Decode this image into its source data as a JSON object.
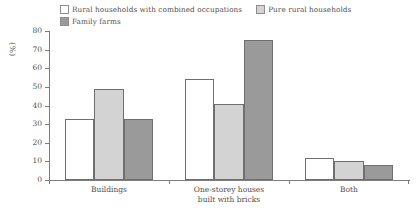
{
  "chart_data": {
    "type": "bar",
    "title": "",
    "subtitle": "",
    "xlabel": "",
    "ylabel": "(%)",
    "ylim": [
      0,
      80
    ],
    "ytick_step": 10,
    "yticks": [
      80,
      70,
      60,
      50,
      40,
      30,
      20,
      10,
      0
    ],
    "grid": false,
    "legend_position": "top",
    "categories": [
      "Buildings",
      "One-storey houses built with bricks",
      "Both"
    ],
    "category_lines": [
      [
        "Buildings"
      ],
      [
        "One-storey houses",
        "built with bricks"
      ],
      [
        "Both"
      ]
    ],
    "series": [
      {
        "name": "Rural households with combined occupations",
        "color": "#ffffff",
        "values": [
          33,
          54,
          12
        ]
      },
      {
        "name": "Pure rural households",
        "color": "#d3d3d3",
        "values": [
          49,
          41,
          10
        ]
      },
      {
        "name": "Family farms",
        "color": "#9a9a9a",
        "values": [
          33,
          75,
          8
        ]
      }
    ]
  },
  "legend": {
    "entries": [
      {
        "label": "Rural households with combined occupations",
        "swatch": "white"
      },
      {
        "label": "Pure rural households",
        "swatch": "light"
      },
      {
        "label": "Family farms",
        "swatch": "dark"
      }
    ]
  },
  "axis": {
    "y_title": "(%)",
    "y_labels": [
      "80",
      "70",
      "60",
      "50",
      "40",
      "30",
      "20",
      "10",
      "0"
    ]
  },
  "colors": {
    "series_white": "#ffffff",
    "series_light": "#d3d3d3",
    "series_dark": "#9a9a9a",
    "axis": "#7c7c7c",
    "bar_outline": "#6f6f6f",
    "text": "#4f4f4f",
    "background": "#ffffff"
  }
}
